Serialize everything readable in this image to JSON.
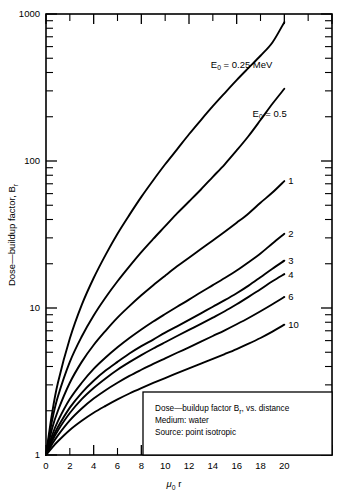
{
  "figure": {
    "background_color": "#ffffff",
    "line_color": "#000000"
  },
  "chart_data": {
    "type": "line",
    "title": "",
    "xlabel": "μ₀r",
    "ylabel": "Dose—buildup factor, Bᵣ",
    "yscale": "log",
    "xscale": "linear",
    "xlim": [
      0,
      24
    ],
    "ylim": [
      1,
      1000
    ],
    "grid": false,
    "legend_position": "curve-end-labels",
    "xticks": [
      0,
      2,
      4,
      6,
      8,
      10,
      12,
      14,
      16,
      18,
      20,
      22,
      24
    ],
    "xtick_labels": [
      "0",
      "2",
      "4",
      "6",
      "8",
      "10",
      "12",
      "14",
      "16",
      "18",
      "20",
      "",
      ""
    ],
    "yticks": [
      1,
      10,
      100,
      1000
    ],
    "ytick_labels": [
      "1",
      "10",
      "100",
      "1000"
    ],
    "yminor_decade_multipliers": [
      2,
      3,
      4,
      5,
      6,
      7,
      8,
      9
    ],
    "series": [
      {
        "name": "E0 = 0.25 MeV",
        "label": "E₀  =  0.25  MeV",
        "label_kind": "annotation",
        "x": [
          0,
          0.5,
          1,
          2,
          3,
          4,
          5,
          6,
          7,
          8,
          9,
          10,
          11,
          12,
          13,
          14,
          15,
          16,
          17,
          18,
          19,
          20
        ],
        "y": [
          1,
          1.9,
          3.1,
          6.2,
          10.5,
          16.0,
          23.0,
          32.0,
          43.0,
          57.0,
          74.0,
          95.0,
          120,
          152,
          190,
          236,
          290,
          355,
          430,
          520,
          640,
          880
        ]
      },
      {
        "name": "E0 = 0.5 MeV",
        "label": "E₀  =  0.5",
        "label_kind": "annotation",
        "x": [
          0,
          0.5,
          1,
          2,
          3,
          4,
          5,
          6,
          7,
          8,
          9,
          10,
          11,
          12,
          13,
          14,
          15,
          16,
          17,
          18,
          19,
          20
        ],
        "y": [
          1,
          1.7,
          2.5,
          4.3,
          6.4,
          8.9,
          11.8,
          15.2,
          19.2,
          24.0,
          29.5,
          36.0,
          44.0,
          53.0,
          64.0,
          78.0,
          95.0,
          118,
          148,
          190,
          245,
          310
        ]
      },
      {
        "name": "E0 = 1 MeV",
        "label": "1",
        "label_kind": "end-label",
        "x": [
          0,
          0.5,
          1,
          2,
          3,
          4,
          5,
          6,
          7,
          8,
          9,
          10,
          11,
          12,
          13,
          14,
          15,
          16,
          17,
          18,
          19,
          20
        ],
        "y": [
          1,
          1.5,
          2.0,
          3.1,
          4.3,
          5.6,
          7.0,
          8.6,
          10.3,
          12.2,
          14.3,
          16.6,
          19.2,
          22.0,
          25.2,
          28.8,
          33.0,
          38.0,
          44.0,
          52.0,
          61.0,
          73.0
        ]
      },
      {
        "name": "E0 = 2 MeV",
        "label": "2",
        "label_kind": "end-label",
        "x": [
          0,
          0.5,
          1,
          2,
          3,
          4,
          5,
          6,
          7,
          8,
          9,
          10,
          11,
          12,
          13,
          14,
          15,
          16,
          17,
          18,
          19,
          20
        ],
        "y": [
          1,
          1.35,
          1.7,
          2.4,
          3.1,
          3.85,
          4.6,
          5.4,
          6.25,
          7.15,
          8.1,
          9.1,
          10.2,
          11.4,
          12.8,
          14.3,
          16.0,
          18.0,
          20.5,
          23.5,
          27.5,
          32.0
        ]
      },
      {
        "name": "E0 = 3 MeV",
        "label": "3",
        "label_kind": "end-label",
        "x": [
          0,
          0.5,
          1,
          2,
          3,
          4,
          5,
          6,
          7,
          8,
          9,
          10,
          11,
          12,
          13,
          14,
          15,
          16,
          17,
          18,
          19,
          20
        ],
        "y": [
          1,
          1.28,
          1.55,
          2.1,
          2.65,
          3.2,
          3.75,
          4.3,
          4.9,
          5.5,
          6.1,
          6.8,
          7.5,
          8.3,
          9.2,
          10.2,
          11.3,
          12.6,
          14.2,
          16.2,
          18.5,
          21.0
        ]
      },
      {
        "name": "E0 = 4 MeV",
        "label": "4",
        "label_kind": "end-label",
        "x": [
          0,
          0.5,
          1,
          2,
          3,
          4,
          5,
          6,
          7,
          8,
          9,
          10,
          11,
          12,
          13,
          14,
          15,
          16,
          17,
          18,
          19,
          20
        ],
        "y": [
          1,
          1.24,
          1.47,
          1.93,
          2.4,
          2.86,
          3.32,
          3.8,
          4.28,
          4.78,
          5.3,
          5.85,
          6.45,
          7.1,
          7.8,
          8.6,
          9.5,
          10.6,
          11.9,
          13.4,
          15.2,
          17.0
        ]
      },
      {
        "name": "E0 = 6 MeV",
        "label": "6",
        "label_kind": "end-label",
        "x": [
          0,
          0.5,
          1,
          2,
          3,
          4,
          5,
          6,
          7,
          8,
          9,
          10,
          11,
          12,
          13,
          14,
          15,
          16,
          17,
          18,
          19,
          20
        ],
        "y": [
          1,
          1.18,
          1.36,
          1.72,
          2.07,
          2.42,
          2.76,
          3.1,
          3.45,
          3.8,
          4.17,
          4.55,
          4.96,
          5.4,
          5.9,
          6.45,
          7.05,
          7.75,
          8.55,
          9.5,
          10.6,
          11.9
        ]
      },
      {
        "name": "E0 = 10 MeV",
        "label": "10",
        "label_kind": "end-label",
        "x": [
          0,
          0.5,
          1,
          2,
          3,
          4,
          5,
          6,
          7,
          8,
          9,
          10,
          11,
          12,
          13,
          14,
          15,
          16,
          17,
          18,
          19,
          20
        ],
        "y": [
          1,
          1.12,
          1.24,
          1.48,
          1.71,
          1.94,
          2.16,
          2.39,
          2.62,
          2.85,
          3.09,
          3.34,
          3.6,
          3.88,
          4.18,
          4.5,
          4.86,
          5.26,
          5.72,
          6.25,
          6.9,
          7.7
        ]
      }
    ],
    "annotations": [
      {
        "text": "E₀  =  0.25  MeV",
        "x": 19.0,
        "y": 430
      },
      {
        "text": "E₀  =  0.5",
        "x": 20.2,
        "y": 200
      }
    ],
    "caption_box": {
      "lines": [
        "Dose—buildup factor Bᵣ, vs. distance",
        "Medium:  water",
        "Source:  point isotropic"
      ]
    }
  }
}
